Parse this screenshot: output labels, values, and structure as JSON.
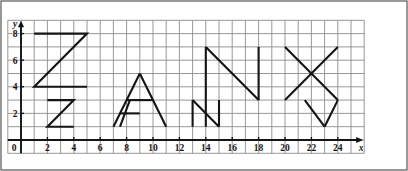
{
  "figure": {
    "title": "",
    "background_color": "#ffffff",
    "grid_line_color": "#8c8c8c",
    "axis_color": "#141414",
    "letter_stroke_color": "#141414",
    "border_color": "#6e6e6e"
  },
  "axes": {
    "x_axis": {
      "name": "x",
      "tick_labels": [
        "0",
        "2",
        "4",
        "6",
        "8",
        "10",
        "12",
        "14",
        "16",
        "18",
        "20",
        "22",
        "24"
      ],
      "tick_values": [
        0,
        2,
        4,
        6,
        8,
        10,
        12,
        14,
        16,
        18,
        20,
        22,
        24
      ],
      "min": -1,
      "max": 26,
      "arrow": true
    },
    "y_axis": {
      "name": "y",
      "tick_labels": [
        "2",
        "4",
        "6",
        "8"
      ],
      "tick_values": [
        2,
        4,
        6,
        8
      ],
      "min": -1,
      "max": 9,
      "arrow": true
    },
    "origin_label": "0",
    "grid_step": 1
  },
  "chart_data": {
    "type": "line",
    "title": "",
    "xlabel": "x",
    "ylabel": "y",
    "xlim": [
      -1,
      26
    ],
    "ylim": [
      -1,
      9
    ],
    "grid": true,
    "legend": "none",
    "series": [
      {
        "name": "Z-uppercase",
        "closed": false,
        "points": [
          [
            1,
            8
          ],
          [
            5,
            8
          ],
          [
            1,
            4
          ],
          [
            5,
            4
          ]
        ]
      },
      {
        "name": "z-lowercase",
        "closed": false,
        "points": [
          [
            2,
            3
          ],
          [
            4,
            3
          ],
          [
            2,
            1
          ],
          [
            4,
            1
          ]
        ]
      },
      {
        "name": "A-left-leg",
        "closed": false,
        "points": [
          [
            7,
            1
          ],
          [
            9,
            5
          ]
        ]
      },
      {
        "name": "A-right-leg",
        "closed": false,
        "points": [
          [
            9,
            5
          ],
          [
            11,
            1
          ]
        ]
      },
      {
        "name": "A-upper-crossbar",
        "closed": false,
        "points": [
          [
            8,
            3
          ],
          [
            10,
            3
          ]
        ]
      },
      {
        "name": "A-lower-crossbar",
        "closed": false,
        "points": [
          [
            7.5,
            2
          ],
          [
            9,
            2
          ]
        ]
      },
      {
        "name": "a-lowercase-left-leg",
        "closed": false,
        "points": [
          [
            7.5,
            1
          ],
          [
            8.25,
            3
          ]
        ]
      },
      {
        "name": "N-uppercase",
        "closed": false,
        "points": [
          [
            14,
            7
          ],
          [
            14,
            1
          ]
        ]
      },
      {
        "name": "N-uppercase-diagonal",
        "closed": false,
        "points": [
          [
            14,
            7
          ],
          [
            18,
            3
          ]
        ]
      },
      {
        "name": "N-uppercase-right-stem",
        "closed": false,
        "points": [
          [
            18,
            7
          ],
          [
            18,
            3
          ]
        ]
      },
      {
        "name": "n-lowercase-left-stem",
        "closed": false,
        "points": [
          [
            13,
            3
          ],
          [
            13,
            1
          ]
        ]
      },
      {
        "name": "n-lowercase-diagonal",
        "closed": false,
        "points": [
          [
            13,
            3
          ],
          [
            15,
            1
          ]
        ]
      },
      {
        "name": "n-lowercase-right-stem",
        "closed": false,
        "points": [
          [
            15,
            3
          ],
          [
            15,
            1
          ]
        ]
      },
      {
        "name": "X-stroke-1",
        "closed": false,
        "points": [
          [
            20,
            7
          ],
          [
            24,
            3
          ]
        ]
      },
      {
        "name": "X-stroke-2",
        "closed": false,
        "points": [
          [
            20,
            3
          ],
          [
            24,
            7
          ]
        ]
      },
      {
        "name": "v-lowercase-stroke-1",
        "closed": false,
        "points": [
          [
            21.5,
            3
          ],
          [
            23,
            1
          ]
        ]
      },
      {
        "name": "v-lowercase-stroke-2",
        "closed": false,
        "points": [
          [
            23,
            1
          ],
          [
            24,
            3
          ]
        ]
      }
    ]
  }
}
